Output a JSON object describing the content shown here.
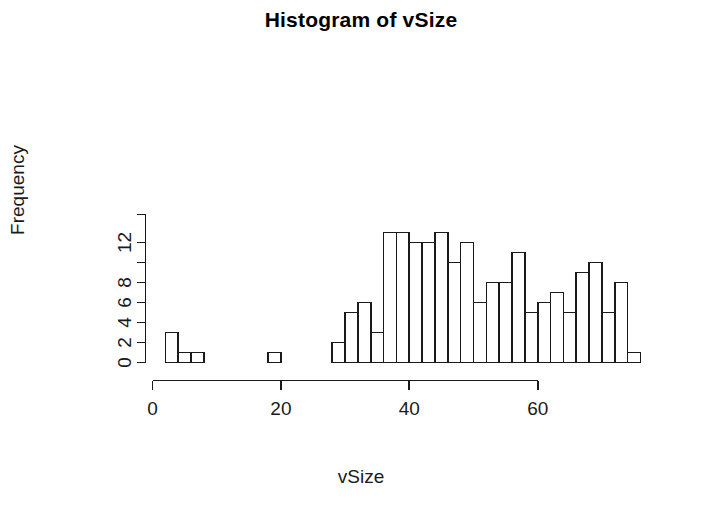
{
  "chart_data": {
    "type": "bar",
    "title": "Histogram of vSize",
    "xlabel": "vSize",
    "ylabel": "Frequency",
    "grid": false,
    "legend": "none",
    "bin_width": 2,
    "xlim": [
      0,
      76
    ],
    "ylim": [
      0,
      13
    ],
    "xticks": [
      0,
      20,
      40,
      60
    ],
    "xtick_labels": [
      "0",
      "20",
      "40",
      "60"
    ],
    "yticks": [
      0,
      2,
      4,
      6,
      8,
      10,
      12
    ],
    "ytick_labels": [
      "0",
      "2",
      "4",
      "6",
      "8",
      "",
      "12"
    ],
    "bins": [
      {
        "start": 2,
        "end": 4,
        "count": 3
      },
      {
        "start": 4,
        "end": 6,
        "count": 1
      },
      {
        "start": 6,
        "end": 8,
        "count": 1
      },
      {
        "start": 18,
        "end": 20,
        "count": 1
      },
      {
        "start": 28,
        "end": 30,
        "count": 2
      },
      {
        "start": 30,
        "end": 32,
        "count": 5
      },
      {
        "start": 32,
        "end": 34,
        "count": 6
      },
      {
        "start": 34,
        "end": 36,
        "count": 3
      },
      {
        "start": 36,
        "end": 38,
        "count": 13
      },
      {
        "start": 38,
        "end": 40,
        "count": 13
      },
      {
        "start": 40,
        "end": 42,
        "count": 12
      },
      {
        "start": 42,
        "end": 44,
        "count": 12
      },
      {
        "start": 44,
        "end": 46,
        "count": 13
      },
      {
        "start": 46,
        "end": 48,
        "count": 10
      },
      {
        "start": 48,
        "end": 50,
        "count": 12
      },
      {
        "start": 50,
        "end": 52,
        "count": 6
      },
      {
        "start": 52,
        "end": 54,
        "count": 8
      },
      {
        "start": 54,
        "end": 56,
        "count": 8
      },
      {
        "start": 56,
        "end": 58,
        "count": 11
      },
      {
        "start": 58,
        "end": 60,
        "count": 5
      },
      {
        "start": 60,
        "end": 62,
        "count": 6
      },
      {
        "start": 62,
        "end": 64,
        "count": 7
      },
      {
        "start": 64,
        "end": 66,
        "count": 5
      },
      {
        "start": 66,
        "end": 68,
        "count": 9
      },
      {
        "start": 68,
        "end": 70,
        "count": 10
      },
      {
        "start": 70,
        "end": 72,
        "count": 5
      },
      {
        "start": 72,
        "end": 74,
        "count": 8
      },
      {
        "start": 74,
        "end": 76,
        "count": 1
      }
    ],
    "axis_color": "#1a1a1a",
    "bar_fill": "#ffffff",
    "bar_stroke": "#1a1a1a"
  }
}
